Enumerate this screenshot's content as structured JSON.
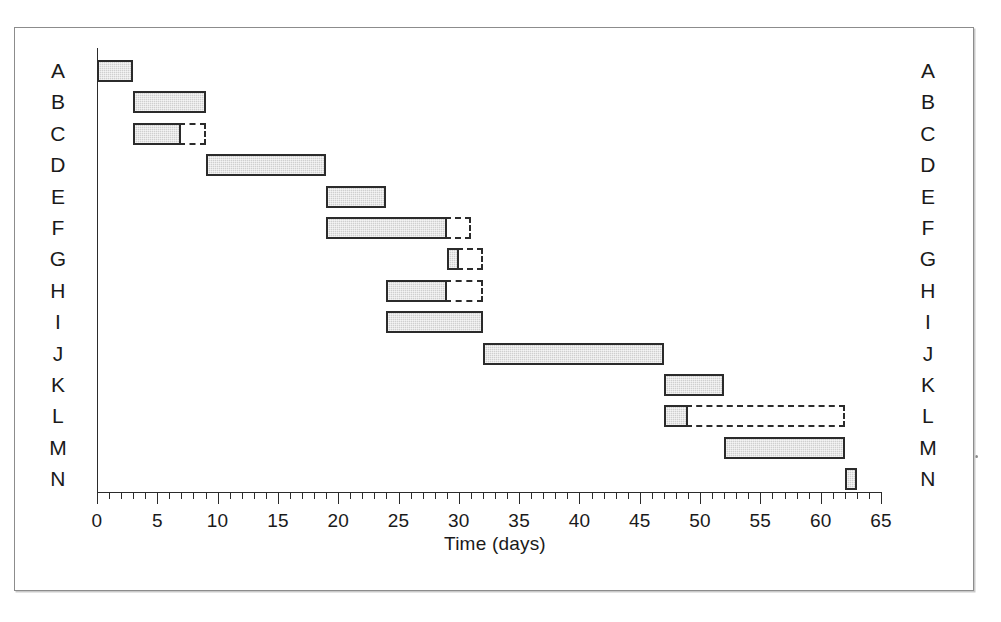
{
  "figure": {
    "top_cut_text": "",
    "x_axis_title": "Time (days)",
    "x_tick_labels": [
      "0",
      "5",
      "10",
      "15",
      "20",
      "25",
      "30",
      "35",
      "40",
      "45",
      "50",
      "55",
      "60",
      "65"
    ],
    "x_tick_values": [
      0,
      5,
      10,
      15,
      20,
      25,
      30,
      35,
      40,
      45,
      50,
      55,
      60,
      65
    ],
    "row_labels_left": [
      "A",
      "B",
      "C",
      "D",
      "E",
      "F",
      "G",
      "H",
      "I",
      "J",
      "K",
      "L",
      "M",
      "N"
    ],
    "row_labels_right": [
      "A",
      "B",
      "C",
      "D",
      "E",
      "F",
      "G",
      "H",
      "I",
      "J",
      "K",
      "L",
      "M",
      "N"
    ],
    "bar_fill_color": "#cfcfcf",
    "bar_border_color": "#2b2b2b",
    "frame_color": "#8c8c8c"
  },
  "chart_data": {
    "type": "bar",
    "chart_subtype": "gantt",
    "title": "",
    "xlabel": "Time (days)",
    "ylabel": "",
    "xlim": [
      0,
      65
    ],
    "x_major_tick_interval": 5,
    "x_minor_tick_interval": 1,
    "grid": false,
    "legend": null,
    "categories": [
      "A",
      "B",
      "C",
      "D",
      "E",
      "F",
      "G",
      "H",
      "I",
      "J",
      "K",
      "L",
      "M",
      "N"
    ],
    "tasks": [
      {
        "label": "A",
        "start": 0,
        "end": 3,
        "duration": 3,
        "float_end": null,
        "float": 0
      },
      {
        "label": "B",
        "start": 3,
        "end": 9,
        "duration": 6,
        "float_end": null,
        "float": 0
      },
      {
        "label": "C",
        "start": 3,
        "end": 7,
        "duration": 4,
        "float_end": 9,
        "float": 2
      },
      {
        "label": "D",
        "start": 9,
        "end": 19,
        "duration": 10,
        "float_end": null,
        "float": 0
      },
      {
        "label": "E",
        "start": 19,
        "end": 24,
        "duration": 5,
        "float_end": null,
        "float": 0
      },
      {
        "label": "F",
        "start": 19,
        "end": 29,
        "duration": 10,
        "float_end": 31,
        "float": 2
      },
      {
        "label": "G",
        "start": 29,
        "end": 30,
        "duration": 1,
        "float_end": 32,
        "float": 2
      },
      {
        "label": "H",
        "start": 24,
        "end": 29,
        "duration": 5,
        "float_end": 32,
        "float": 3
      },
      {
        "label": "I",
        "start": 24,
        "end": 32,
        "duration": 8,
        "float_end": null,
        "float": 0
      },
      {
        "label": "J",
        "start": 32,
        "end": 47,
        "duration": 15,
        "float_end": null,
        "float": 0
      },
      {
        "label": "K",
        "start": 47,
        "end": 52,
        "duration": 5,
        "float_end": null,
        "float": 0
      },
      {
        "label": "L",
        "start": 47,
        "end": 49,
        "duration": 2,
        "float_end": 62,
        "float": 13
      },
      {
        "label": "M",
        "start": 52,
        "end": 62,
        "duration": 10,
        "float_end": null,
        "float": 0
      },
      {
        "label": "N",
        "start": 62,
        "end": 63,
        "duration": 1,
        "float_end": null,
        "float": 0
      }
    ]
  }
}
